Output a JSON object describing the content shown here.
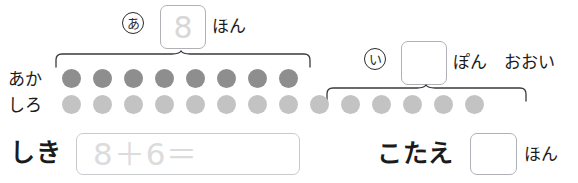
{
  "worksheet": {
    "language": "ja",
    "type": "addition-with-counters"
  },
  "group_a": {
    "marker": "あ",
    "box_value": "8",
    "unit_label": "ほん",
    "row_label": "あか",
    "count": 8
  },
  "group_i": {
    "marker": "い",
    "box_value": "",
    "unit_label": "ぽん　おおい",
    "row_label": "しろ",
    "count": 6
  },
  "rows": {
    "aka": {
      "label": "あか",
      "dot_count": 8,
      "dot_color": "#8e8e8e"
    },
    "shiro": {
      "label": "しろ",
      "dot_count": 14,
      "dot_color": "#c3c3c3"
    }
  },
  "shiki": {
    "label": "しき",
    "value": "8＋6＝",
    "placeholder": "8＋6＝"
  },
  "kotae": {
    "label": "こたえ",
    "value": "",
    "unit_label": "ほん"
  },
  "colors": {
    "ink": "#1b1b1b",
    "box_border": "#aeb2b6",
    "shiki_border": "#c8cbce",
    "hint_text": "#dcdcdc",
    "dot_dark": "#8e8e8e",
    "dot_light": "#c3c3c3",
    "brace": "#3a3a3a"
  }
}
